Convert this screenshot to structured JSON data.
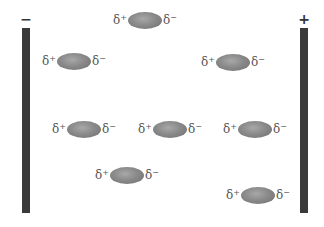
{
  "negative_plate": {
    "sign": "−"
  },
  "positive_plate": {
    "sign": "+"
  },
  "molecule_labels": {
    "plus": "δ",
    "plus_sup": "+",
    "minus": "δ",
    "minus_sup": "−"
  },
  "molecules": [
    {
      "x": 42,
      "y": 52
    },
    {
      "x": 113,
      "y": 11
    },
    {
      "x": 201,
      "y": 53
    },
    {
      "x": 52,
      "y": 120
    },
    {
      "x": 138,
      "y": 120
    },
    {
      "x": 223,
      "y": 120
    },
    {
      "x": 95,
      "y": 166
    },
    {
      "x": 226,
      "y": 186
    }
  ]
}
